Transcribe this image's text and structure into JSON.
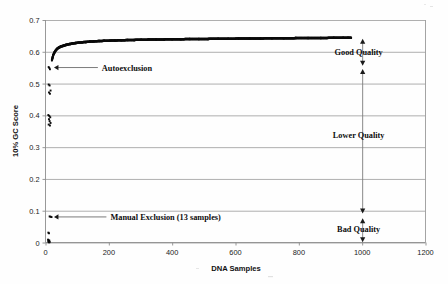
{
  "chart_data": {
    "type": "scatter",
    "title": "",
    "xlabel": "DNA Samples",
    "ylabel": "10% GC Score",
    "xlim": [
      0,
      1200
    ],
    "ylim": [
      0,
      0.7
    ],
    "grid": "horizontal",
    "legend_position": "none",
    "xticks": [
      "0",
      "200",
      "400",
      "600",
      "800",
      "1000",
      "1200"
    ],
    "xtick_values": [
      0,
      200,
      400,
      600,
      800,
      1000,
      1200
    ],
    "yticks": [
      "0",
      "0.1",
      "0.2",
      "0.3",
      "0.4",
      "0.5",
      "0.6",
      "0.7"
    ],
    "ytick_values": [
      0,
      0.1,
      0.2,
      0.3,
      0.4,
      0.5,
      0.6,
      0.7
    ],
    "series": [
      {
        "name": "10% GC Score (ranked DNA samples)",
        "description": "Dense monotonically increasing band of points rising steeply from ~0.57 then plateauing near 0.645",
        "x": [
          20,
          24,
          28,
          32,
          36,
          40,
          44,
          48,
          53,
          58,
          64,
          70,
          77,
          85,
          94,
          104,
          115,
          127,
          140,
          154,
          169,
          185,
          202,
          220,
          239,
          259,
          280,
          302,
          325,
          349,
          374,
          400,
          427,
          455,
          484,
          514,
          545,
          577,
          610,
          644,
          679,
          715,
          752,
          790,
          829,
          869,
          910,
          940,
          955,
          965
        ],
        "y": [
          0.573,
          0.589,
          0.598,
          0.604,
          0.609,
          0.612,
          0.6145,
          0.6165,
          0.618,
          0.6195,
          0.6215,
          0.623,
          0.6245,
          0.626,
          0.6275,
          0.6288,
          0.63,
          0.631,
          0.632,
          0.633,
          0.6338,
          0.6345,
          0.635,
          0.6357,
          0.6363,
          0.6369,
          0.6374,
          0.6379,
          0.6383,
          0.6387,
          0.639,
          0.6394,
          0.6397,
          0.64,
          0.6403,
          0.6406,
          0.6409,
          0.6412,
          0.6415,
          0.6418,
          0.6421,
          0.6424,
          0.6427,
          0.643,
          0.6433,
          0.6436,
          0.6439,
          0.6441,
          0.6442,
          0.6443
        ]
      },
      {
        "name": "Autoexclusion outliers",
        "description": "Low-score samples removed automatically",
        "x": [
          10,
          12,
          14,
          10,
          13,
          16,
          11,
          14,
          9,
          12,
          15,
          11,
          13,
          16,
          10,
          14
        ],
        "y": [
          0.552,
          0.549,
          0.545,
          0.497,
          0.494,
          0.478,
          0.472,
          0.468,
          0.401,
          0.398,
          0.394,
          0.388,
          0.382,
          0.376,
          0.371,
          0.368
        ]
      },
      {
        "name": "Manual Exclusion outliers",
        "description": "13 samples excluded manually at very low score",
        "x": [
          13,
          16,
          19,
          9,
          11,
          8,
          10,
          12,
          9,
          11,
          13,
          10,
          12
        ],
        "y": [
          0.082,
          0.081,
          0.08,
          0.031,
          0.029,
          0.009,
          0.007,
          0.006,
          0.004,
          0.003,
          0.002,
          0.001,
          0.0005
        ]
      }
    ],
    "annotations": [
      {
        "id": "autoexclusion",
        "label": "Autoexclusion",
        "points_to_x": 22,
        "points_to_y": 0.552,
        "text_x": 178,
        "text_y": 0.552
      },
      {
        "id": "manual-exclusion",
        "label": "Manual Exclusion (13 samples)",
        "points_to_x": 22,
        "points_to_y": 0.082,
        "text_x": 205,
        "text_y": 0.082
      }
    ],
    "quality_brackets": [
      {
        "id": "good-quality",
        "label": "Good Quality",
        "at_x": 1000,
        "y_top": 0.641,
        "y_bottom": 0.556,
        "label_y": 0.598
      },
      {
        "id": "lower-quality",
        "label": "Lower Quality",
        "at_x": 1000,
        "y_top": 0.546,
        "y_bottom": 0.091,
        "label_y": 0.338
      },
      {
        "id": "bad-quality",
        "label": "Bad Quality",
        "at_x": 1000,
        "y_top": 0.076,
        "y_bottom": 0.001,
        "label_y": 0.043
      }
    ]
  },
  "axes": {
    "y_axis_title": "10% GC Score",
    "x_axis_title": "DNA Samples"
  }
}
